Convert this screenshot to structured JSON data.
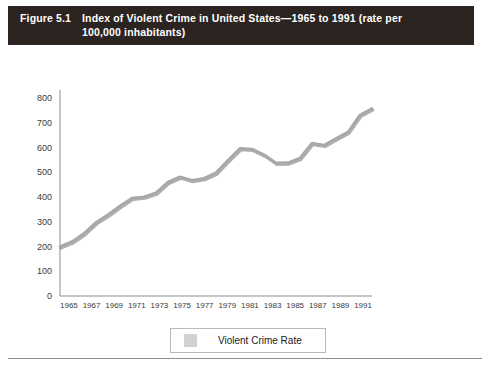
{
  "figure": {
    "label": "Figure 5.1",
    "title_line1": "Index of Violent Crime in United States—1965 to 1991 (rate per",
    "title_line2": "100,000 inhabitants)"
  },
  "legend": {
    "label": "Violent Crime Rate",
    "swatch_color": "#d2d2d2"
  },
  "colors": {
    "banner_background": "#2b2420",
    "banner_text": "#ffffff",
    "line": "#9a9a9a",
    "line_shadow": "#5e5e5e",
    "axis": "#8d8d8d",
    "page_background": "#ffffff"
  },
  "chart_data": {
    "type": "line",
    "title": "Index of Violent Crime in United States—1965 to 1991 (rate per 100,000 inhabitants)",
    "xlabel": "",
    "ylabel": "",
    "ylim": [
      0,
      800
    ],
    "yticks": [
      0,
      100,
      200,
      300,
      400,
      500,
      600,
      700,
      800
    ],
    "xlim": [
      1965,
      1991
    ],
    "xticks": [
      1965,
      1967,
      1969,
      1971,
      1973,
      1975,
      1977,
      1979,
      1981,
      1983,
      1985,
      1987,
      1989,
      1991
    ],
    "grid": false,
    "legend_position": "bottom",
    "series": [
      {
        "name": "Violent Crime Rate",
        "x": [
          1965,
          1966,
          1967,
          1968,
          1969,
          1970,
          1971,
          1972,
          1973,
          1974,
          1975,
          1976,
          1977,
          1978,
          1979,
          1980,
          1981,
          1982,
          1983,
          1984,
          1985,
          1986,
          1987,
          1988,
          1989,
          1990,
          1991
        ],
        "values": [
          200,
          220,
          253,
          298,
          329,
          364,
          396,
          401,
          417,
          461,
          482,
          468,
          476,
          498,
          549,
          597,
          594,
          571,
          538,
          539,
          558,
          618,
          610,
          637,
          663,
          732,
          758
        ]
      }
    ]
  }
}
